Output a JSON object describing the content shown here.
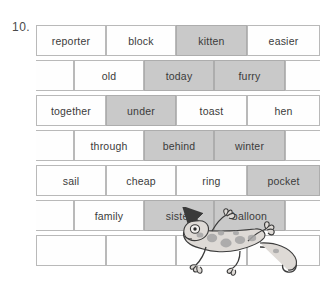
{
  "question_number": "10.",
  "colors": {
    "shaded_brick": "#c9c9c9",
    "plain_brick": "#fefefe",
    "brick_border": "#b9b9b9",
    "text": "#3b3b3b",
    "gecko_body": "#d9d5d2",
    "gecko_spots": "#9a9a9a",
    "arrow": "#3a3a3a"
  },
  "wall": {
    "rows": [
      {
        "index": 0,
        "offset": 0,
        "bricks": [
          {
            "label": "reporter",
            "shaded": false,
            "x": 0,
            "w": 70
          },
          {
            "label": "block",
            "shaded": false,
            "x": 70,
            "w": 70
          },
          {
            "label": "kitten",
            "shaded": true,
            "x": 140,
            "w": 71
          },
          {
            "label": "easier",
            "shaded": false,
            "x": 211,
            "w": 73
          }
        ]
      },
      {
        "index": 1,
        "offset": 36,
        "bricks": [
          {
            "label": "",
            "shaded": false,
            "x": -36,
            "w": 74
          },
          {
            "label": "old",
            "shaded": false,
            "x": 38,
            "w": 70
          },
          {
            "label": "today",
            "shaded": true,
            "x": 108,
            "w": 70
          },
          {
            "label": "furry",
            "shaded": true,
            "x": 178,
            "w": 71
          },
          {
            "label": "",
            "shaded": false,
            "x": 249,
            "w": 72
          }
        ]
      },
      {
        "index": 2,
        "offset": 0,
        "bricks": [
          {
            "label": "together",
            "shaded": false,
            "x": 0,
            "w": 70
          },
          {
            "label": "under",
            "shaded": true,
            "x": 70,
            "w": 70
          },
          {
            "label": "toast",
            "shaded": false,
            "x": 140,
            "w": 71
          },
          {
            "label": "hen",
            "shaded": false,
            "x": 211,
            "w": 73
          }
        ]
      },
      {
        "index": 3,
        "offset": 36,
        "bricks": [
          {
            "label": "",
            "shaded": false,
            "x": -36,
            "w": 74
          },
          {
            "label": "through",
            "shaded": false,
            "x": 38,
            "w": 70
          },
          {
            "label": "behind",
            "shaded": true,
            "x": 108,
            "w": 70
          },
          {
            "label": "winter",
            "shaded": true,
            "x": 178,
            "w": 71
          },
          {
            "label": "",
            "shaded": false,
            "x": 249,
            "w": 72
          }
        ]
      },
      {
        "index": 4,
        "offset": 0,
        "bricks": [
          {
            "label": "sail",
            "shaded": false,
            "x": 0,
            "w": 70
          },
          {
            "label": "cheap",
            "shaded": false,
            "x": 70,
            "w": 70
          },
          {
            "label": "ring",
            "shaded": false,
            "x": 140,
            "w": 71
          },
          {
            "label": "pocket",
            "shaded": true,
            "x": 211,
            "w": 73
          }
        ]
      },
      {
        "index": 5,
        "offset": 36,
        "bricks": [
          {
            "label": "",
            "shaded": false,
            "x": -36,
            "w": 74
          },
          {
            "label": "family",
            "shaded": false,
            "x": 38,
            "w": 70
          },
          {
            "label": "sister",
            "shaded": true,
            "x": 108,
            "w": 70
          },
          {
            "label": "balloon",
            "shaded": true,
            "x": 178,
            "w": 71
          },
          {
            "label": "",
            "shaded": false,
            "x": 249,
            "w": 72
          }
        ]
      },
      {
        "index": 6,
        "offset": 0,
        "bricks": [
          {
            "label": "",
            "shaded": false,
            "x": 0,
            "w": 70
          },
          {
            "label": "",
            "shaded": false,
            "x": 70,
            "w": 70
          },
          {
            "label": "",
            "shaded": false,
            "x": 140,
            "w": 71
          },
          {
            "label": "",
            "shaded": false,
            "x": 211,
            "w": 73
          }
        ]
      }
    ]
  },
  "illustration": {
    "gecko_name": "gecko-illustration",
    "arrow_name": "pointer-arrow",
    "points_at": "sister"
  }
}
